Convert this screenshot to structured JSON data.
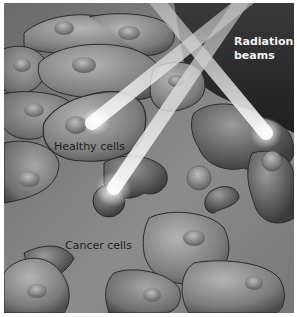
{
  "figure": {
    "labels": {
      "radiation_beams_line1": "Radiation",
      "radiation_beams_line2": "beams",
      "healthy_cells": "Healthy cells",
      "cancer_cells": "Cancer cells"
    },
    "colors": {
      "background_dark": "#2a2a2a",
      "tissue": "#8a8a8a",
      "cell_light": "#a8a8a8",
      "cell_dark": "#555555",
      "outline": "#2b2b2b",
      "beam": "#e6e6e6",
      "beam_glow": "#ffffff"
    }
  }
}
